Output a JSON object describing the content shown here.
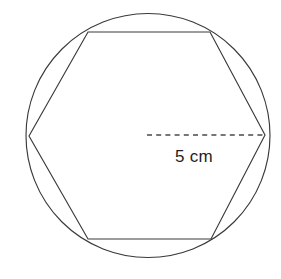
{
  "figure": {
    "name": "circle-with-inscribed-hexagon",
    "background_color": "#ffffff",
    "stroke_color": "#3a3a3a",
    "dash_color": "#4a4a4a",
    "text_color": "#231f20"
  },
  "circle": {
    "label": "circle",
    "center_x": 148,
    "center_y": 135.5,
    "radius": 122
  },
  "hexagon": {
    "label": "inscribed-hexagon",
    "sides": 6,
    "points": "29,136 88,32 210,32 265,135 211,239 88,239",
    "vertices": [
      {
        "name": "vertex-left",
        "x": 29,
        "y": 136
      },
      {
        "name": "vertex-top-left",
        "x": 88,
        "y": 32
      },
      {
        "name": "vertex-top-right",
        "x": 210,
        "y": 32
      },
      {
        "name": "vertex-right",
        "x": 265,
        "y": 135
      },
      {
        "name": "vertex-bottom-right",
        "x": 211,
        "y": 239
      },
      {
        "name": "vertex-bottom-left",
        "x": 88,
        "y": 239
      }
    ]
  },
  "radius_line": {
    "label": "dashed-radius",
    "x1": 147,
    "y1": 135,
    "x2": 265,
    "y2": 135
  },
  "measurement_label": {
    "text": "5 cm",
    "value": 5,
    "unit": "cm",
    "x": 175,
    "y": 162
  },
  "chart_data": {
    "type": "diagram",
    "title": "",
    "shapes": [
      {
        "shape": "circle",
        "center": [
          148,
          135.5
        ],
        "radius_px": 122,
        "radius_value": 5,
        "radius_unit": "cm"
      },
      {
        "shape": "regular-hexagon",
        "inscribed_in": "circle",
        "side_count": 6,
        "vertices_px": [
          [
            29,
            136
          ],
          [
            88,
            32
          ],
          [
            210,
            32
          ],
          [
            265,
            135
          ],
          [
            211,
            239
          ],
          [
            88,
            239
          ]
        ]
      },
      {
        "shape": "dashed-segment",
        "from_px": [
          147,
          135
        ],
        "to_px": [
          265,
          135
        ],
        "label": "5 cm"
      }
    ],
    "annotations": [
      {
        "text": "5 cm",
        "x": 175,
        "y": 162
      }
    ]
  }
}
